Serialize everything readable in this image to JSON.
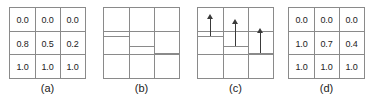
{
  "figure": {
    "background_color": "#ffffff",
    "line_color": "#8a8a8a",
    "arrow_color": "#3a3a3a",
    "text_color": "#222222",
    "grid_rows": 3,
    "grid_cols": 3
  },
  "panels": [
    {
      "id": "panel-a",
      "caption": "(a)",
      "type": "value-grid",
      "values": [
        [
          "0.0",
          "0.0",
          "0.0"
        ],
        [
          "0.8",
          "0.5",
          "0.2"
        ],
        [
          "1.0",
          "1.0",
          "1.0"
        ]
      ]
    },
    {
      "id": "panel-b",
      "caption": "(b)",
      "type": "level-grid",
      "levels": [
        "high",
        "middle",
        "low"
      ],
      "arrows": false
    },
    {
      "id": "panel-c",
      "caption": "(c)",
      "type": "level-grid",
      "levels": [
        "high",
        "middle",
        "low"
      ],
      "arrows": true,
      "arrow_direction": "up"
    },
    {
      "id": "panel-d",
      "caption": "(d)",
      "type": "value-grid",
      "values": [
        [
          "0.0",
          "0.0",
          "0.0"
        ],
        [
          "1.0",
          "0.7",
          "0.4"
        ],
        [
          "1.0",
          "1.0",
          "1.0"
        ]
      ]
    }
  ]
}
